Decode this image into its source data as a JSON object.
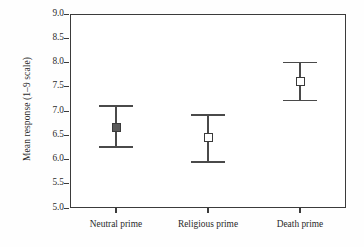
{
  "chart_data": {
    "type": "scatter",
    "title": "",
    "xlabel": "",
    "ylabel": "Mean response (1–9 scale)",
    "categories": [
      "Neutral prime",
      "Religious prime",
      "Death prime"
    ],
    "values": [
      6.66,
      6.45,
      7.61
    ],
    "error_low": [
      6.26,
      5.95,
      7.22
    ],
    "error_high": [
      7.1,
      6.92,
      8.0
    ],
    "series": [
      {
        "name": "Mean response",
        "points": [
          {
            "category": "Neutral prime",
            "mean": 6.66,
            "ci_low": 6.26,
            "ci_high": 7.1,
            "marker": "filled-square"
          },
          {
            "category": "Religious prime",
            "mean": 6.45,
            "ci_low": 5.95,
            "ci_high": 6.92,
            "marker": "open-square"
          },
          {
            "category": "Death prime",
            "mean": 7.61,
            "ci_low": 7.22,
            "ci_high": 8.0,
            "marker": "open-square"
          }
        ]
      }
    ],
    "ylim": [
      5.0,
      9.0
    ],
    "ytick_labels": [
      "9.0",
      "8.5",
      "8.0",
      "7.5",
      "7.0",
      "6.5",
      "6.0",
      "5.5",
      "5.0"
    ],
    "ytick_values": [
      9.0,
      8.5,
      8.0,
      7.5,
      7.0,
      6.5,
      6.0,
      5.5,
      5.0
    ],
    "ytick_step": 0.5,
    "grid": false,
    "legend": "none",
    "error_bar_type": "confidence interval",
    "colors": {
      "axis": "#3b3b3b",
      "marker_edge": "#3a3a3a",
      "marker_fill_filled": "#5a5a5a",
      "marker_fill_open": "#ffffff",
      "error_bar": "#4a4a4a",
      "text": "#2a2a2a",
      "background": "#ffffff"
    }
  }
}
